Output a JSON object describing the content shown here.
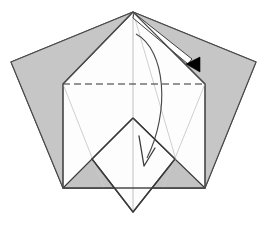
{
  "figure": {
    "title": "Origami folding step diagram",
    "width": 267,
    "height": 228,
    "background_color": "#ffffff"
  },
  "palette": {
    "paper_front": "#ffffff",
    "paper_back": "#c8c8c8",
    "paper_back_shadow": "#bcbcbc",
    "edge_stroke": "#3a3a3a",
    "soft_crease": "#a9a9a9",
    "faint_crease": "#c4c4c4",
    "dashed_crease": "#2f2f2f",
    "arrow_fill": "#000000",
    "arrow_stroke": "#1a1a1a"
  },
  "geometry": {
    "apex": {
      "x": 133,
      "y": 12
    },
    "pentagon_left": {
      "x": 11,
      "y": 62
    },
    "pentagon_right": {
      "x": 256,
      "y": 62
    },
    "pentagon_bottom_left": {
      "x": 63,
      "y": 188
    },
    "pentagon_bottom_right": {
      "x": 205,
      "y": 188
    },
    "white_shoulder_left": {
      "x": 63,
      "y": 84
    },
    "white_shoulder_right": {
      "x": 205,
      "y": 84
    },
    "flap_top": {
      "x": 133,
      "y": 118
    },
    "flap_left": {
      "x": 92,
      "y": 159
    },
    "flap_right": {
      "x": 175,
      "y": 159
    },
    "flap_bottom": {
      "x": 133,
      "y": 212
    },
    "center_line_x": 133
  },
  "shapes": {
    "outer_pentagon": {
      "name": "outer-pentagon-sheet",
      "points": "133,12 256,62 205,188 63,188 11,62",
      "fill_key": "paper_back"
    },
    "left_back_panel": {
      "name": "left-back-panel",
      "points": "133,12 63,84 63,188 11,62",
      "fill_key": "paper_back"
    },
    "right_back_panel": {
      "name": "right-back-panel",
      "points": "133,12 256,62 205,188 205,84",
      "fill_key": "paper_back"
    },
    "white_body": {
      "name": "white-front-body",
      "points": "133,12 205,84 205,188 63,188 63,84",
      "fill_key": "paper_front"
    },
    "lower_left_gray_triangle": {
      "name": "lower-left-back-triangle",
      "points": "63,188 92,159 121,188",
      "fill_key": "paper_back"
    },
    "lower_right_gray_triangle": {
      "name": "lower-right-back-triangle",
      "points": "147,188 175,159 205,188",
      "fill_key": "paper_back"
    },
    "center_flap_diamond": {
      "name": "center-flap-diamond",
      "points": "133,118 175,159 133,212 92,159",
      "fill_key": "paper_front"
    }
  },
  "creases": {
    "valley_dashed": {
      "name": "horizontal-valley-crease",
      "x1": 63,
      "y1": 84,
      "x2": 205,
      "y2": 84,
      "style": "dashed",
      "dash_pattern": "7 4"
    },
    "center_vertical": {
      "name": "center-vertical-crease",
      "x1": 133,
      "y1": 12,
      "x2": 133,
      "y2": 212,
      "style": "faint"
    },
    "left_diagonal_soft": {
      "name": "left-soft-diagonal-crease",
      "x1": 133,
      "y1": 12,
      "x2": 63,
      "y2": 84,
      "style": "soft"
    },
    "right_diagonal_soft": {
      "name": "right-soft-diagonal-crease",
      "x1": 133,
      "y1": 12,
      "x2": 205,
      "y2": 84,
      "style": "soft"
    },
    "flap_left_edge": {
      "name": "flap-left-edge",
      "x1": 133,
      "y1": 118,
      "x2": 92,
      "y2": 159,
      "style": "edge"
    },
    "flap_right_edge": {
      "name": "flap-right-edge",
      "x1": 133,
      "y1": 118,
      "x2": 175,
      "y2": 159,
      "style": "edge"
    },
    "flap_left_lower": {
      "name": "flap-lower-left-edge",
      "x1": 92,
      "y1": 159,
      "x2": 133,
      "y2": 212,
      "style": "edge"
    },
    "flap_right_lower": {
      "name": "flap-lower-right-edge",
      "x1": 175,
      "y1": 159,
      "x2": 133,
      "y2": 212,
      "style": "edge"
    },
    "inner_left_faint": {
      "name": "inner-left-faint-crease",
      "x1": 63,
      "y1": 84,
      "x2": 104,
      "y2": 188,
      "style": "faint"
    },
    "inner_right_faint": {
      "name": "inner-right-faint-crease",
      "x1": 205,
      "y1": 84,
      "x2": 163,
      "y2": 188,
      "style": "faint"
    },
    "apex_to_flap_faint": {
      "name": "apex-to-flap-faint-crease",
      "x1": 133,
      "y1": 12,
      "x2": 175,
      "y2": 159,
      "style": "faint"
    }
  },
  "arrows": {
    "fold_arrow_main": {
      "name": "main-fold-arrow",
      "label": "fold front flap down",
      "path": "M 136,34 C 164,48 168,110 147,158",
      "head": "143,166 140,139 152,150",
      "style": "curved-outline"
    },
    "unfold_arrow_small": {
      "name": "unfold-return-arrow",
      "label": "return / unfold to the right",
      "path": "M 136,16 L 190,60",
      "shaft": "134,14 139,15 194,58 190,62",
      "head": "200,57 200,72 186,64",
      "style": "straight-solid-head"
    }
  },
  "annotations": {
    "step_number": "",
    "caption": ""
  }
}
